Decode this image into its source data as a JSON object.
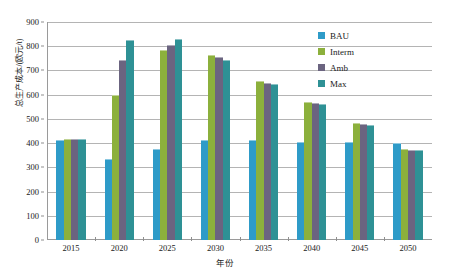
{
  "chart_data": {
    "type": "bar",
    "title": "",
    "xlabel": "年份",
    "ylabel": "总生产成本/(欧元/t)",
    "categories": [
      "2015",
      "2020",
      "2025",
      "2030",
      "2035",
      "2040",
      "2045",
      "2050"
    ],
    "ylim": [
      0,
      900
    ],
    "ytick_step": 100,
    "yticks": [
      "0",
      "100",
      "200",
      "300",
      "400",
      "500",
      "600",
      "700",
      "800",
      "900"
    ],
    "grid": "horizontal",
    "legend_position": "top-right",
    "series": [
      {
        "name": "BAU",
        "color": "#2E9BC8",
        "values": [
          415,
          335,
          375,
          415,
          412,
          405,
          403,
          400
        ]
      },
      {
        "name": "Interm",
        "color": "#8CB03C",
        "values": [
          418,
          600,
          785,
          763,
          655,
          568,
          482,
          375
        ]
      },
      {
        "name": "Amb",
        "color": "#6B6480",
        "values": [
          418,
          745,
          805,
          755,
          650,
          565,
          480,
          373
        ]
      },
      {
        "name": "Max",
        "color": "#2E9195",
        "values": [
          418,
          825,
          830,
          745,
          643,
          562,
          477,
          370
        ]
      }
    ]
  },
  "legend": {
    "items": [
      {
        "label": "BAU",
        "color": "#2E9BC8"
      },
      {
        "label": "Interm",
        "color": "#8CB03C"
      },
      {
        "label": "Amb",
        "color": "#6B6480"
      },
      {
        "label": "Max",
        "color": "#2E9195"
      }
    ]
  },
  "axes": {
    "y_title": "总生产成本/(欧元/t)",
    "x_title": "年份"
  }
}
